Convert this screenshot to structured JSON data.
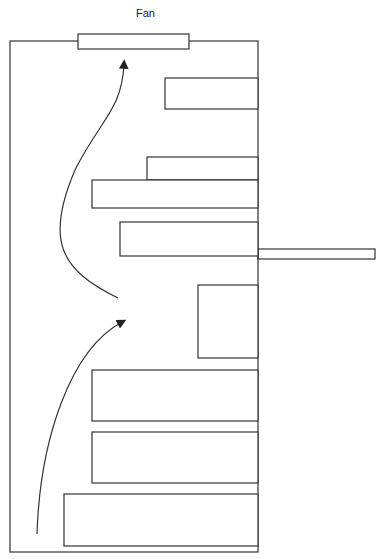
{
  "labels": {
    "fan": "Fan"
  },
  "colors": {
    "stroke": "#333333",
    "background": "#ffffff"
  },
  "diagram": {
    "enclosure": {
      "x": 10,
      "y": 41,
      "w": 248,
      "h": 511
    },
    "fan": {
      "x": 78,
      "y": 34,
      "w": 111,
      "h": 15
    },
    "protrusion": {
      "x": 258,
      "y": 249,
      "w": 117,
      "h": 10
    },
    "components": [
      {
        "x": 165,
        "y": 78,
        "w": 93,
        "h": 31
      },
      {
        "x": 147,
        "y": 157,
        "w": 111,
        "h": 23
      },
      {
        "x": 92,
        "y": 180,
        "w": 166,
        "h": 28
      },
      {
        "x": 120,
        "y": 222,
        "w": 138,
        "h": 34
      },
      {
        "x": 198,
        "y": 285,
        "w": 60,
        "h": 73
      },
      {
        "x": 92,
        "y": 370,
        "w": 166,
        "h": 51
      },
      {
        "x": 92,
        "y": 432,
        "w": 166,
        "h": 51
      },
      {
        "x": 64,
        "y": 494,
        "w": 194,
        "h": 52
      }
    ],
    "arrows": [
      {
        "name": "upper-airflow",
        "path": "M118,298 C60,270 45,240 75,170 C100,120 122,110 124,64"
      },
      {
        "name": "lower-airflow",
        "path": "M37,534 C40,440 70,350 122,322"
      }
    ]
  }
}
